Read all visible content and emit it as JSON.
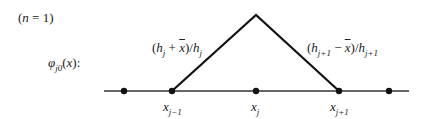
{
  "caption": "(n = 1)",
  "function_label": "φ_{j0}(x):",
  "left_slope_label": "(h_j + x̄)/h_j",
  "right_slope_label": "(h_{j+1} − x̄)/h_{j+1}",
  "nodes": [
    {
      "x": 124,
      "label": ""
    },
    {
      "x": 172,
      "label": "x_{j−1}"
    },
    {
      "x": 256,
      "label": "x_j"
    },
    {
      "x": 339,
      "label": "x_{j+1}"
    },
    {
      "x": 389,
      "label": ""
    }
  ],
  "axis": {
    "x1": 104,
    "x2": 409,
    "y": 91
  },
  "peak": {
    "x": 256,
    "y": 15
  },
  "colors": {
    "line": "#111111",
    "axis": "#333333"
  }
}
